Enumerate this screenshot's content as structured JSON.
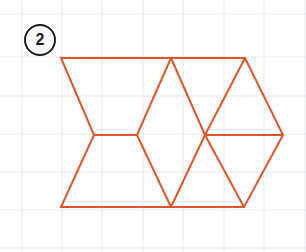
{
  "canvas": {
    "width": 306,
    "height": 252,
    "background_color": "#FFFFFF"
  },
  "badge": {
    "label": "2",
    "shape": "circle",
    "border_color": "#1D1D1D",
    "text_color": "#1D1D1D",
    "center_x": 40,
    "center_y": 40,
    "radius": 16
  },
  "grid": {
    "visible": true,
    "line_color": "#E6E9EC",
    "line_width": 1,
    "spacing_x": 40.5,
    "spacing_y": 38.5,
    "vertical_x": [
      22,
      62,
      102,
      143,
      183,
      224,
      264,
      305
    ],
    "horizontal_y": [
      14,
      57,
      96,
      134,
      172,
      210,
      248
    ]
  },
  "figure": {
    "name": "tessellation-outline",
    "stroke_color": "#E0552B",
    "stroke_width": 2,
    "fill": "none",
    "vertices": {
      "top_left": [
        61,
        58
      ],
      "top_mid": [
        171,
        58
      ],
      "top_right": [
        245,
        58
      ],
      "left_mid": [
        94,
        135
      ],
      "inner_left": [
        137,
        135
      ],
      "inner_right": [
        205,
        135
      ],
      "far_right": [
        283,
        135
      ],
      "bottom_left": [
        61,
        207
      ],
      "bottom_mid": [
        171,
        207
      ],
      "bottom_right": [
        244,
        207
      ]
    },
    "paths": [
      {
        "name": "outer-boundary",
        "d": "M 61 58 L 171 58 L 245 58 L 283 135 L 244 207 L 171 207 L 61 207 L 94 135 Z"
      },
      {
        "name": "middle-horizontal-left",
        "d": "M 94 135 L 137 135"
      },
      {
        "name": "middle-horizontal-right",
        "d": "M 205 135 L 283 135"
      },
      {
        "name": "upper-left-diamond-edge",
        "d": "M 171 58 L 137 135"
      },
      {
        "name": "upper-right-diamond-edge",
        "d": "M 171 58 L 205 135"
      },
      {
        "name": "lower-left-diamond-edge",
        "d": "M 137 135 L 171 207"
      },
      {
        "name": "lower-right-diamond-edge",
        "d": "M 205 135 L 171 207"
      },
      {
        "name": "right-upper-slant",
        "d": "M 245 58 L 205 135"
      },
      {
        "name": "right-lower-slant",
        "d": "M 205 135 L 244 207"
      }
    ]
  }
}
